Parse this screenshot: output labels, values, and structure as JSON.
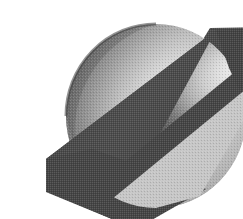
{
  "image": {
    "kind": "logo-graphic",
    "title": "Planet with diagonal band logo",
    "alt_text": "Grayscale shaded sphere crossed by a dark diagonal band",
    "width": 243,
    "height": 219,
    "background_color": "#ffffff",
    "rendering_style": "dithered halftone grayscale",
    "caption": ""
  },
  "palette": {
    "background": "#ffffff",
    "band_dark": "#4a4a4a",
    "band_dark_alt": "#3f3f3f",
    "sphere_shadow": "#4f4f4f",
    "sphere_mid": "#9a9a9a",
    "sphere_light": "#d2d2d2",
    "sphere_highlight": "#ececec",
    "sphere_lower_right": "#c4c4c4",
    "outline": "#2b2b2b"
  },
  "shapes": {
    "sphere": {
      "name": "sphere",
      "center_x": 116,
      "center_y": 100,
      "radius_x": 90,
      "radius_y": 92,
      "highlight_x": 157,
      "highlight_y": 70,
      "label": "Sphere"
    },
    "band": {
      "name": "diagonal-band",
      "label": "Diagonal band",
      "angle_degrees": 27,
      "front_segment_points": "6,143 58,131 243,47 243,13 176,14",
      "back_segment_points": "176,14 243,13 243,47",
      "lower_tip_points": "6,143 6,175 96,213 163,176",
      "thickness_over_sphere": 19
    }
  },
  "layers": [
    {
      "name": "band-back",
      "label": "Band behind sphere",
      "z": 1
    },
    {
      "name": "sphere-body",
      "label": "Sphere body",
      "z": 2
    },
    {
      "name": "band-front",
      "label": "Band in front of sphere",
      "z": 3
    }
  ]
}
